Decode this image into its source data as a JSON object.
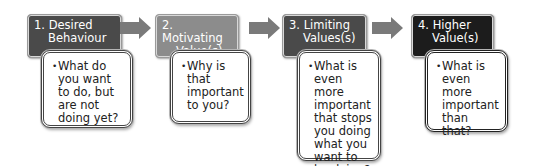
{
  "diagram": {
    "steps": [
      {
        "number": "1.",
        "title_line1": "Desired",
        "title_line2": "Behaviour",
        "question": "What do you want to do, but are not doing yet?",
        "header_color": "#4a4a4a"
      },
      {
        "number": "2.",
        "title_line1": "Motivating",
        "title_line2": "Value(s)",
        "question": "Why is that important to you?",
        "header_color": "#8c8c8c"
      },
      {
        "number": "3.",
        "title_line1": "Limiting",
        "title_line2": "Values(s)",
        "question": "What is even more important that stops you doing what you want to be doing?",
        "header_color": "#4a4a4a"
      },
      {
        "number": "4.",
        "title_line1": "Higher",
        "title_line2": "Value(s)",
        "question": "What is even more important than that?",
        "header_color": "#1c1c1c"
      }
    ],
    "arrow_color": "#7a7a7a",
    "bullet": "•"
  }
}
